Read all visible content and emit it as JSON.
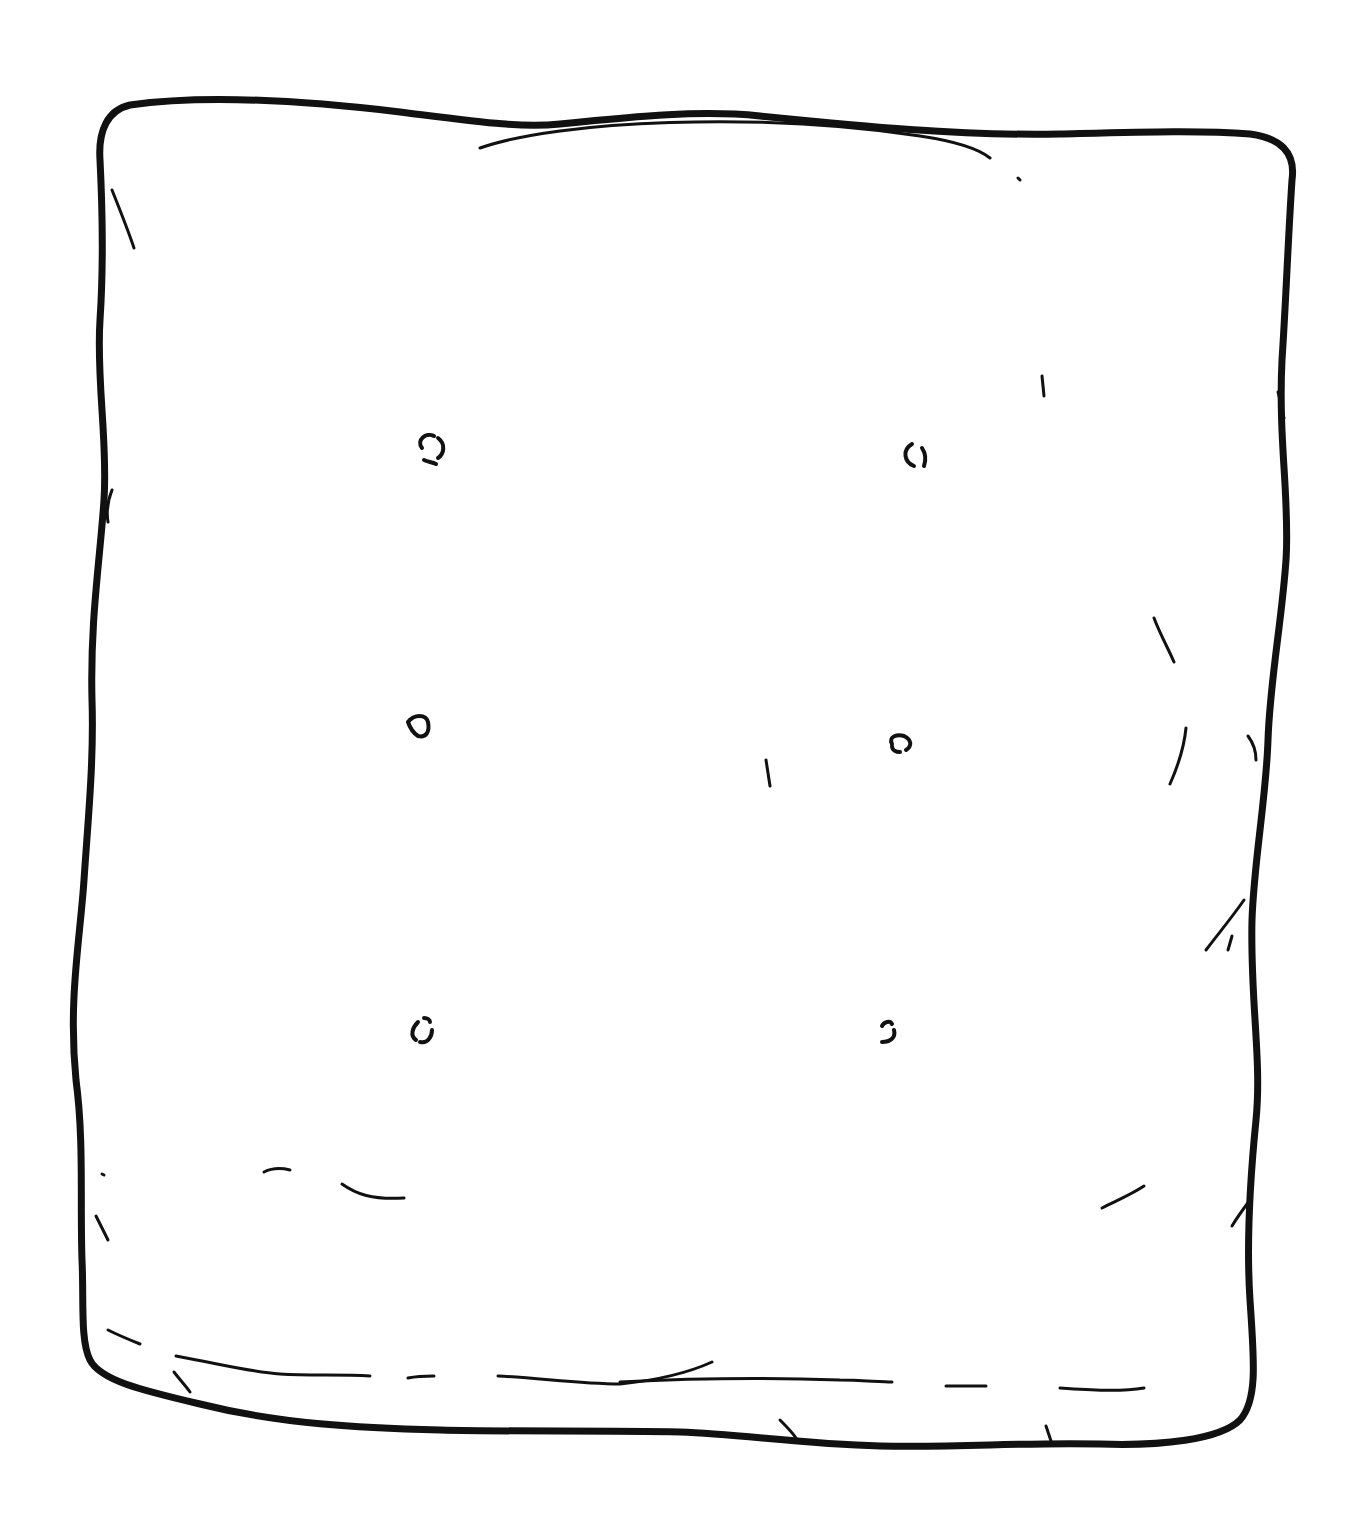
{
  "image": {
    "subject": "graham cracker line drawing",
    "stroke_color": "#111111",
    "background_color": "#ffffff",
    "docking_holes_count": 6
  }
}
